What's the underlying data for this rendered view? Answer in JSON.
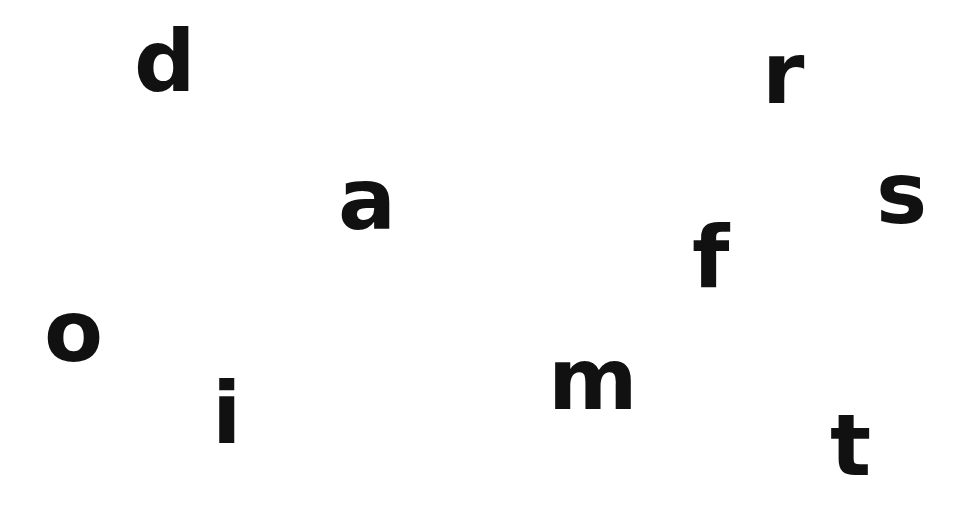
{
  "letters": [
    {
      "char": "d",
      "x": 134,
      "y": 20
    },
    {
      "char": "r",
      "x": 762,
      "y": 32
    },
    {
      "char": "a",
      "x": 340,
      "y": 166
    },
    {
      "char": "s",
      "x": 878,
      "y": 160
    },
    {
      "char": "f",
      "x": 694,
      "y": 212
    },
    {
      "char": "o",
      "x": 46,
      "y": 292
    },
    {
      "char": "i",
      "x": 216,
      "y": 374
    },
    {
      "char": "m",
      "x": 550,
      "y": 344
    },
    {
      "char": "t",
      "x": 832,
      "y": 404
    }
  ],
  "colors": {
    "background": "#ffffff",
    "text": "#111111"
  }
}
